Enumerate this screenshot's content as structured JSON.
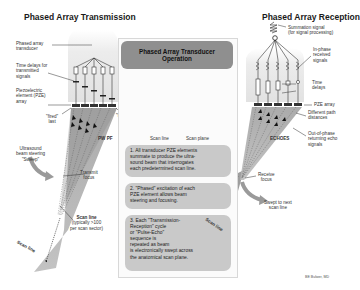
{
  "left": {
    "title": "Phased Array Transmission",
    "labels": {
      "transducer": [
        "Phased array",
        "transducer"
      ],
      "time_delays": [
        "Time delays for",
        "transmitted",
        "signals"
      ],
      "pze": [
        "Piezoelectric",
        "element (PZE)",
        "array"
      ],
      "fired_last": [
        "\"fired\"",
        "last"
      ],
      "fired_first": [
        "\"fired\"",
        "first"
      ],
      "wavefront": "PW PF",
      "steering": [
        "Ultrasound",
        "beam steering",
        "\"Sweep\""
      ],
      "transmit_focus": [
        "Transmit",
        "focus"
      ],
      "scan_line_title": "Scan line",
      "scan_line_sub": [
        "(typically >100",
        "per scan sector)"
      ],
      "scan_line_beam": "Scan line"
    }
  },
  "center": {
    "header": [
      "Phased Array Transducer",
      "Operation"
    ],
    "fan_labels": {
      "scan_line": "Scan line",
      "scan_plane": "Scan plane"
    },
    "steps": [
      [
        "1. All transducer PZE elements",
        "summate to produce the ultra-",
        "sound beam that interrogates",
        "each predetermined scan line."
      ],
      [
        "2. \"Phased\" excitation of each",
        "PZE element allows beam",
        "steering and focusing."
      ],
      [
        "3. Each \"Transmission-",
        "Reception\" cycle",
        "or \"Pulse-Echo\"",
        "sequence is",
        "repeated as beam",
        "is electronically swept across",
        "the anatomical scan plane."
      ]
    ],
    "beam_label": "Scan line"
  },
  "right": {
    "title": "Phased Array Reception",
    "labels": {
      "summation": [
        "Summation signal",
        "(for signal processing)"
      ],
      "in_phase": [
        "In-phase",
        "received",
        "signals"
      ],
      "time_delays": [
        "Time",
        "delays"
      ],
      "pze": "PZE array",
      "path": [
        "Different path",
        "distances"
      ],
      "echoes": "ECHOES",
      "out_of_phase": [
        "Out-of-phase",
        "returning echo",
        "signals"
      ],
      "receive_focus": [
        "Receive",
        "focus"
      ],
      "swept": [
        "Swept to next",
        "scan line"
      ]
    }
  },
  "credit": "BE Bulwer, MD",
  "colors": {
    "box_dark": "#8f8f8f",
    "box_light": "#c9c9c9",
    "beam": "#a8a8a8"
  }
}
